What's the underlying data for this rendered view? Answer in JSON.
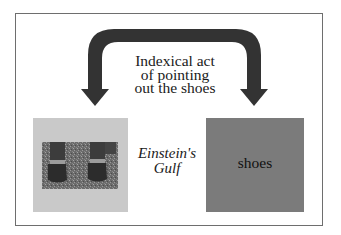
{
  "diagram": {
    "caption_lines": [
      "Indexical act",
      "of pointing",
      "out the shoes"
    ],
    "gulf_label_lines": [
      "Einstein's",
      "Gulf"
    ],
    "right_box_label": "shoes",
    "left_box_image": "photo of two feet wearing dark strapped shoes on gravel",
    "colors": {
      "arrow": "#333333",
      "left_box": "#c9c9c9",
      "right_box": "#7b7b7b",
      "frame_border": "#6e6e6e",
      "background": "#ffffff"
    }
  }
}
